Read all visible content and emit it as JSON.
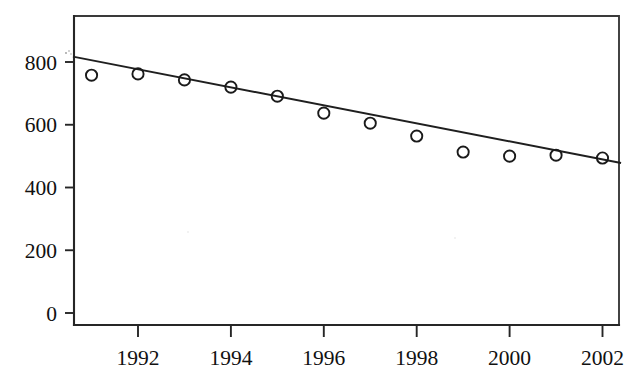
{
  "chart_data": {
    "type": "scatter",
    "title": "",
    "subtitle": "",
    "xlabel": "",
    "ylabel": "",
    "x": [
      1991,
      1992,
      1993,
      1994,
      1995,
      1996,
      1997,
      1998,
      1999,
      2000,
      2001,
      2002
    ],
    "values": [
      758,
      762,
      743,
      720,
      691,
      637,
      605,
      564,
      513,
      500,
      503,
      494
    ],
    "series": [
      {
        "name": "observations",
        "marker": "open-circle",
        "values": [
          758,
          762,
          743,
          720,
          691,
          637,
          605,
          564,
          513,
          500,
          503,
          494
        ]
      },
      {
        "name": "linear-trend",
        "type": "line",
        "endpoints": [
          {
            "x": 1990.6,
            "y": 817
          },
          {
            "x": 2002.4,
            "y": 478
          }
        ]
      }
    ],
    "xlim": [
      1990.6,
      2002.4
    ],
    "ylim": [
      0,
      870
    ],
    "xticks": [
      1992,
      1994,
      1996,
      1998,
      2000,
      2002
    ],
    "xtick_labels": [
      "1992",
      "1994",
      "1996",
      "1998",
      "2000",
      "2002"
    ],
    "yticks": [
      0,
      200,
      400,
      600,
      800
    ],
    "ytick_labels": [
      "0",
      "200",
      "400",
      "600",
      "800"
    ],
    "grid": false,
    "legend": null,
    "legend_position": "none",
    "annotations": [],
    "colors": {
      "axis": "#262626",
      "frame": "#3a3a3a",
      "marker": "#1a1a1a",
      "trend": "#1f1f1f",
      "background": "#ffffff"
    }
  },
  "geometry": {
    "plot_left": 74,
    "plot_right": 619,
    "plot_top": 16,
    "plot_bottom": 325,
    "y_zero_px": 313,
    "y_scale_px_per_unit": 0.31375,
    "x_1992_px": 138,
    "x_px_per_year": 46.45,
    "marker_radius": 5.6
  }
}
